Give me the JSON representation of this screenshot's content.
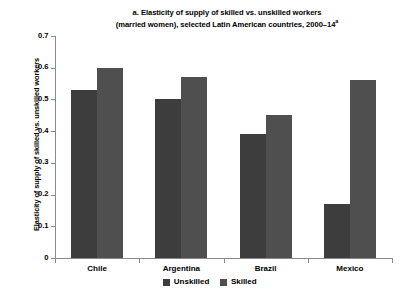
{
  "chart_data": {
    "type": "bar",
    "title_lines": [
      "a. Elasticity of supply of skilled vs. unskilled workers",
      "(married women), selected Latin American countries, 2000–14"
    ],
    "title_superscript": "a",
    "xlabel": "",
    "ylabel": "Elasticity of supply of skilled vs. unskilled workers",
    "categories": [
      "Chile",
      "Argentina",
      "Brazil",
      "Mexico"
    ],
    "series": [
      {
        "name": "Unskilled",
        "color": "#3d3d3d",
        "values": [
          0.53,
          0.5,
          0.39,
          0.17
        ]
      },
      {
        "name": "Skilled",
        "color": "#4f4f4f",
        "values": [
          0.6,
          0.57,
          0.45,
          0.56
        ]
      }
    ],
    "ylim": [
      0,
      0.7
    ],
    "ytick_values": [
      0,
      0.1,
      0.2,
      0.3,
      0.4,
      0.5,
      0.6,
      0.7
    ],
    "ytick_labels": [
      "0",
      "0.1",
      "0.2",
      "0.3",
      "0.4",
      "0.5",
      "0.6",
      "0.7"
    ],
    "grid": false,
    "legend_position": "bottom-center",
    "legend_entries": [
      "Unskilled",
      "Skilled"
    ],
    "axis_color": "#8a8a8a",
    "background": "#ffffff"
  }
}
